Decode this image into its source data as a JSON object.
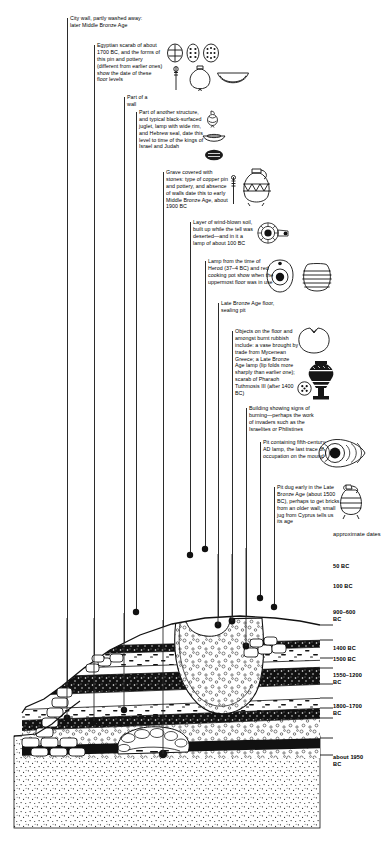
{
  "diagram": {
    "captions": [
      {
        "id": "city-wall",
        "text": "City wall, partly washed away: later Middle Bronze Age"
      },
      {
        "id": "egyptian-scarab",
        "text": "Egyptian scarab of about 1700 BC, and the forms of this pin and pottery (different from earlier ones) show the date of these floor levels"
      },
      {
        "id": "part-of-a-wall",
        "text": "Part of a wall"
      },
      {
        "id": "another-structure",
        "text": "Part of another structure, and typical black-surfaced juglet, lamp with wide rim, and Hebrew seal, date this level to time of the kings of Israel and Judah"
      },
      {
        "id": "grave-covered",
        "text": "Grave covered with stones: type of copper pin and pottery, and absence of walls date this to early Middle Bronze Age, about 1900 BC"
      },
      {
        "id": "wind-blown-soil",
        "text": "Layer of wind-blown soil, built up while the tell was deserted—and in it a lamp of about 100 BC"
      },
      {
        "id": "herod-lamp",
        "text": "Lamp from the time of Herod (37–4 BC) and red cooking pot show when the uppermost floor was in use"
      },
      {
        "id": "lba-floor",
        "text": "Late Bronze Age floor, sealing pit"
      },
      {
        "id": "burnt-rubbish",
        "text": "Objects on the floor and amongst burnt rubbish include: a vase brought by trade from Mycenean Greece; a Late Bronze Age lamp (lip folds more sharply than earlier one); scarab of Pharaoh Tuthmosis III (after 1400 BC)"
      },
      {
        "id": "burning-building",
        "text": "Building showing signs of burning—perhaps the work of invaders such as the Israelites or Philistines"
      },
      {
        "id": "fifth-century-pit",
        "text": "Pit containing fifth-century AD lamp, the last trace of occupation on the mound"
      },
      {
        "id": "lba-pit",
        "text": "Pit dug early in the Late Bronze Age (about 1500 BC), perhaps to get bricks from an older wall; small jug from Cyprus tells us its age"
      }
    ],
    "dates": [
      {
        "id": "approximate-dates",
        "text": "approximate dates"
      },
      {
        "id": "date-50bc",
        "text": "50 BC"
      },
      {
        "id": "date-100bc",
        "text": "100 BC"
      },
      {
        "id": "date-900-600bc",
        "text": "900–600 BC"
      },
      {
        "id": "date-1400bc",
        "text": "1400 BC"
      },
      {
        "id": "date-1500bc",
        "text": "1500 BC"
      },
      {
        "id": "date-1550-1200bc",
        "text": "1550–1200 BC"
      },
      {
        "id": "date-1800-1700bc",
        "text": "1800–1700 BC"
      },
      {
        "id": "date-about-1950bc",
        "text": "about 1950 BC"
      }
    ],
    "artifacts": [
      {
        "id": "scarab-group",
        "name": "egyptian-scarabs"
      },
      {
        "id": "bronze-pin",
        "name": "bronze-pin"
      },
      {
        "id": "juglet-round",
        "name": "round-juglet"
      },
      {
        "id": "open-bowl",
        "name": "open-bowl"
      },
      {
        "id": "black-juglet",
        "name": "black-surfaced-juglet"
      },
      {
        "id": "wide-rim-lamp",
        "name": "wide-rim-lamp"
      },
      {
        "id": "hebrew-seal",
        "name": "hebrew-seal"
      },
      {
        "id": "copper-pin",
        "name": "copper-pin"
      },
      {
        "id": "mb-jug",
        "name": "middle-bronze-jug"
      },
      {
        "id": "hellenistic-lamp",
        "name": "hellenistic-lamp"
      },
      {
        "id": "herod-lamp-art",
        "name": "herodian-lamp"
      },
      {
        "id": "cooking-pot",
        "name": "red-cooking-pot"
      },
      {
        "id": "lba-lamp",
        "name": "late-bronze-age-lamp"
      },
      {
        "id": "mycenean-vase",
        "name": "mycenean-vase"
      },
      {
        "id": "tuthmosis-scarab",
        "name": "tuthmosis-scarab"
      },
      {
        "id": "byzantine-lamp",
        "name": "fifth-century-lamp"
      },
      {
        "id": "cypriot-jug",
        "name": "cypriot-jug"
      }
    ]
  }
}
